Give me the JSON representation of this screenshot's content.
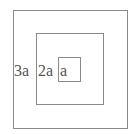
{
  "diagram": {
    "squares": [
      {
        "label": "3a",
        "role": "outer"
      },
      {
        "label": "2a",
        "role": "middle"
      },
      {
        "label": "a",
        "role": "inner"
      }
    ],
    "line_color": "#8a8a8a",
    "text_color": "#555555"
  }
}
